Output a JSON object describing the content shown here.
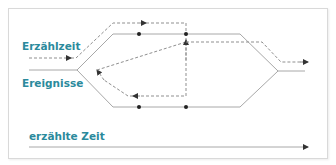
{
  "diagram": {
    "labels": {
      "narration_time": "Erzählzeit",
      "events": "Ereignisse",
      "narrated_time": "erzählte Zeit"
    },
    "colors": {
      "label": "#2b8a9c",
      "solid_line": "#a8a8a8",
      "dashed_line": "#8f8f8f",
      "dot": "#222222",
      "arrow": "#333333",
      "frame": "#d9d9d9"
    }
  }
}
